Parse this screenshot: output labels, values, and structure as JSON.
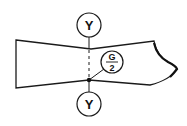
{
  "diagram": {
    "type": "pattern-piece",
    "stroke_color": "#1a1a1a",
    "background": "#ffffff",
    "labels": {
      "top_marker": "Y",
      "bottom_marker": "Y",
      "center_marker_numerator": "G",
      "center_marker_denominator": "2"
    }
  }
}
